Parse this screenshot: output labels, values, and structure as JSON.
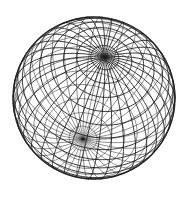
{
  "figure": {
    "background": "#ffffff",
    "stroke_color": "#1a1a1a",
    "stroke_width": 0.9,
    "center": [
      94,
      98
    ],
    "radius": 81,
    "north_pole_screen": [
      105,
      57
    ],
    "south_pole_screen": [
      75,
      174
    ],
    "longitude_lines": 36,
    "latitude_lines": 17,
    "view": {
      "axis_tilt_deg": 59,
      "axis_screen_angle_deg": -15
    }
  }
}
